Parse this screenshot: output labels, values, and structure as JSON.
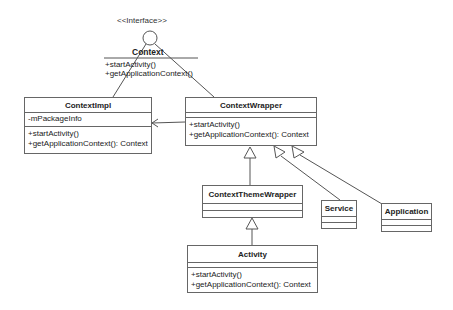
{
  "diagram": {
    "type": "UML class diagram",
    "interface": {
      "stereotype": "<<Interface>>",
      "name": "Context",
      "methods": [
        "+startActivity()",
        "+getApplicationContext()"
      ]
    },
    "classes": {
      "context_impl": {
        "name": "ContextImpl",
        "attributes": [
          "-mPackageInfo"
        ],
        "methods": [
          "+startActivity()",
          "+getApplicationContext(): Context"
        ]
      },
      "context_wrapper": {
        "name": "ContextWrapper",
        "attributes": [],
        "methods": [
          "+startActivity()",
          "+getApplicationContext(): Context"
        ]
      },
      "context_theme_wrapper": {
        "name": "ContextThemeWrapper",
        "attributes": [],
        "methods": []
      },
      "service": {
        "name": "Service",
        "attributes": [],
        "methods": []
      },
      "application": {
        "name": "Application",
        "attributes": [],
        "methods": []
      },
      "activity": {
        "name": "Activity",
        "attributes": [],
        "methods": [
          "+startActivity()",
          "+getApplicationContext(): Context"
        ]
      }
    },
    "relationships": [
      {
        "from": "ContextImpl",
        "to": "Context",
        "type": "realization"
      },
      {
        "from": "ContextWrapper",
        "to": "Context",
        "type": "realization"
      },
      {
        "from": "ContextWrapper",
        "to": "ContextImpl",
        "type": "association"
      },
      {
        "from": "ContextThemeWrapper",
        "to": "ContextWrapper",
        "type": "generalization"
      },
      {
        "from": "Service",
        "to": "ContextWrapper",
        "type": "generalization"
      },
      {
        "from": "Application",
        "to": "ContextWrapper",
        "type": "generalization"
      },
      {
        "from": "Activity",
        "to": "ContextThemeWrapper",
        "type": "generalization"
      }
    ]
  }
}
